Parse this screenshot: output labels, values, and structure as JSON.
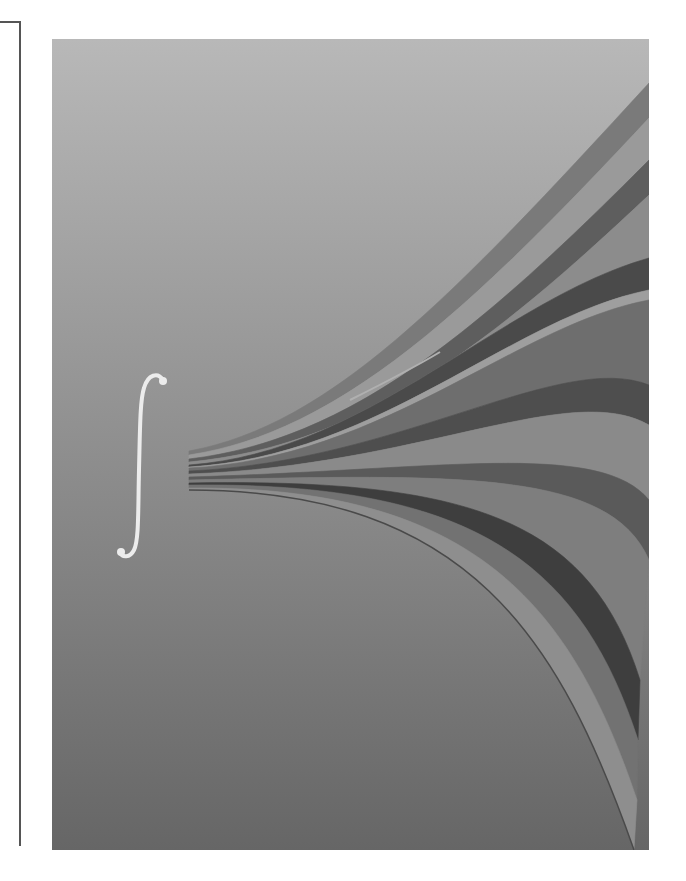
{
  "figure": {
    "panel": {
      "x": 52,
      "y": 39,
      "w": 597,
      "h": 811,
      "top_color": "#b8b8b8",
      "bottom_color": "#666666"
    },
    "integral_symbol": {
      "glyph": "∫",
      "color": "#ececec"
    },
    "bundle_origin": {
      "x": 189,
      "y_top": 451,
      "y_bottom": 490
    },
    "bands": [
      {
        "color": "#7a7a7a",
        "d": "M189,451 C330,425 450,300 649,83 L649,118 C470,310 340,432 189,455 Z"
      },
      {
        "color": "#9a9a9a",
        "d": "M189,455 C340,432 470,310 649,118 L649,160 C480,330 350,440 189,459 Z"
      },
      {
        "color": "#5e5e5e",
        "d": "M189,459 C350,440 480,330 649,160 L649,195 C490,345 360,446 189,462 Z"
      },
      {
        "color": "#8c8c8c",
        "d": "M189,462 C360,446 490,345 649,195 L649,258 C500,300 370,452 189,465 Z"
      },
      {
        "color": "#4a4a4a",
        "d": "M189,465 C370,452 500,300 649,258 L649,290 C510,318 380,456 189,467 Z"
      },
      {
        "color": "#9e9e9e",
        "d": "M189,467 C380,456 510,318 649,290 L649,300 C515,325 385,458 189,468 Z"
      },
      {
        "color": "#6e6e6e",
        "d": "M189,468 C385,458 515,325 649,300 L649,385 C560,350 400,462 189,471 Z"
      },
      {
        "color": "#4e4e4e",
        "d": "M189,471 C400,462 560,350 649,385 L649,425 C570,380 420,466 189,474 Z"
      },
      {
        "color": "#8a8a8a",
        "d": "M189,474 C420,466 570,380 649,425 L649,500 C600,440 440,470 189,477 Z"
      },
      {
        "color": "#5a5a5a",
        "d": "M189,477 C440,470 600,440 649,500 L649,560 C610,470 460,474 189,480 Z"
      },
      {
        "color": "#7e7e7e",
        "d": "M189,480 C460,474 610,470 649,560 L640,680 C590,520 470,478 189,483 Z"
      },
      {
        "color": "#3e3e3e",
        "d": "M189,483 C470,478 590,520 640,680 L638,740 C580,560 470,482 189,485 Z"
      },
      {
        "color": "#727272",
        "d": "M189,485 C470,482 580,560 638,740 L637,800 C570,600 470,486 189,488 Z"
      },
      {
        "color": "#8e8e8e",
        "d": "M189,488 C470,486 570,600 637,800 L634,850 C560,640 470,490 189,490 Z"
      }
    ],
    "highlight_stroke": {
      "color": "#b0b0b0",
      "d": "M350,400 C380,385 410,370 440,352"
    },
    "separator_stroke": {
      "color": "#4a4a4a",
      "d": "M189,490 C470,490 560,640 634,850"
    }
  }
}
